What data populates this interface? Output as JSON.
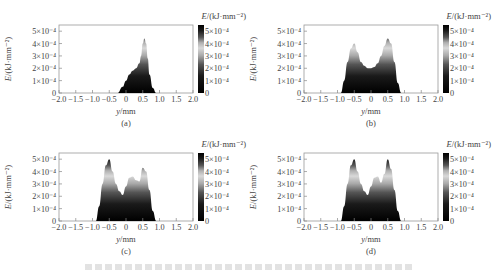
{
  "figure": {
    "caption_visible": false
  },
  "common": {
    "ylabel": "E/(kJ·mm⁻²)",
    "xlabel": "y/mm",
    "colorbar_label": "E/(kJ·mm⁻²)",
    "y_ticks": [
      "0",
      "1×10⁻⁴",
      "2×10⁻⁴",
      "3×10⁻⁴",
      "4×10⁻⁴",
      "5×10⁻⁴"
    ],
    "x_ticks": [
      "−2.0",
      "−1.5",
      "−1.0",
      "−0.5",
      "0",
      "0.5",
      "1.0",
      "1.5",
      "2.0"
    ],
    "colorbar_ticks": [
      "0",
      "1×10⁻⁴",
      "2×10⁻⁴",
      "3×10⁻⁴",
      "4×10⁻⁴",
      "5×10⁻⁴"
    ]
  },
  "chart_data": [
    {
      "type": "area",
      "panel_label": "(a)",
      "xlabel": "y/mm",
      "ylabel": "E/(kJ·mm⁻²)",
      "xlim": [
        -2.0,
        2.0
      ],
      "ylim": [
        0,
        0.00055
      ],
      "colormap": "grayscale (black=0, white≈5.5e-4)",
      "x": [
        -0.25,
        -0.1,
        0.0,
        0.1,
        0.2,
        0.3,
        0.4,
        0.45,
        0.5,
        0.55,
        0.6,
        0.65,
        0.7,
        0.8,
        0.9
      ],
      "values": [
        0,
        5e-05,
        0.0001,
        0.00015,
        0.00018,
        0.0002,
        0.00024,
        0.0003,
        0.0004,
        0.00044,
        0.0004,
        0.00028,
        0.00015,
        4e-05,
        0
      ]
    },
    {
      "type": "area",
      "panel_label": "(b)",
      "xlabel": "y/mm",
      "ylabel": "E/(kJ·mm⁻²)",
      "xlim": [
        -2.0,
        2.0
      ],
      "ylim": [
        0,
        0.00055
      ],
      "colormap": "grayscale (black=0, white≈5.5e-4)",
      "x": [
        -0.9,
        -0.8,
        -0.7,
        -0.6,
        -0.5,
        -0.4,
        -0.3,
        -0.2,
        -0.1,
        0.0,
        0.1,
        0.2,
        0.3,
        0.4,
        0.5,
        0.6,
        0.7,
        0.8,
        0.9
      ],
      "values": [
        0,
        0.0001,
        0.00025,
        0.00036,
        0.0004,
        0.00033,
        0.00025,
        0.00022,
        0.0002,
        0.0002,
        0.00021,
        0.00024,
        0.0003,
        0.00038,
        0.00044,
        0.0004,
        0.00025,
        8e-05,
        0
      ]
    },
    {
      "type": "area",
      "panel_label": "(c)",
      "xlabel": "y/mm",
      "ylabel": "E/(kJ·mm⁻²)",
      "xlim": [
        -2.0,
        2.0
      ],
      "ylim": [
        0,
        0.00055
      ],
      "colormap": "grayscale (black=0, white≈5.5e-4)",
      "x": [
        -0.9,
        -0.8,
        -0.7,
        -0.6,
        -0.5,
        -0.4,
        -0.3,
        -0.2,
        -0.1,
        0.0,
        0.1,
        0.2,
        0.3,
        0.4,
        0.5,
        0.6,
        0.7,
        0.8,
        0.9
      ],
      "values": [
        0,
        0.00012,
        0.0003,
        0.00045,
        0.0005,
        0.0004,
        0.0003,
        0.00024,
        0.00021,
        0.00028,
        0.00035,
        0.00036,
        0.00033,
        0.00032,
        0.00043,
        0.0004,
        0.00025,
        8e-05,
        0
      ]
    },
    {
      "type": "area",
      "panel_label": "(d)",
      "xlabel": "y/mm",
      "ylabel": "E/(kJ·mm⁻²)",
      "xlim": [
        -2.0,
        2.0
      ],
      "ylim": [
        0,
        0.00055
      ],
      "colormap": "grayscale (black=0, white≈5.5e-4)",
      "x": [
        -0.9,
        -0.8,
        -0.7,
        -0.6,
        -0.5,
        -0.4,
        -0.3,
        -0.2,
        -0.1,
        0.0,
        0.1,
        0.2,
        0.3,
        0.4,
        0.5,
        0.6,
        0.7,
        0.8,
        0.9
      ],
      "values": [
        0,
        0.00012,
        0.0003,
        0.00045,
        0.0005,
        0.0004,
        0.0003,
        0.00024,
        0.00021,
        0.00028,
        0.00035,
        0.00036,
        0.00031,
        0.00038,
        0.0005,
        0.00042,
        0.00025,
        8e-05,
        0
      ]
    }
  ]
}
